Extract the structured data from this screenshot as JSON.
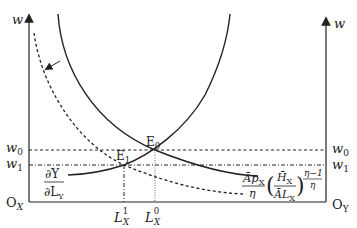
{
  "diagram": {
    "type": "labor-market-equilibrium",
    "axes": {
      "left_axis_label": "w",
      "right_axis_label": "w",
      "left_origin": "O",
      "left_origin_sub": "X",
      "right_origin": "O",
      "right_origin_sub": "Y"
    },
    "wage_levels": {
      "w0": {
        "base": "w",
        "sub": "0"
      },
      "w1": {
        "base": "w",
        "sub": "1"
      }
    },
    "labor_levels": {
      "L1": {
        "base": "L",
        "sub": "X",
        "sup": "1"
      },
      "L0": {
        "base": "L",
        "sub": "X",
        "sup": "0"
      }
    },
    "equilibria": {
      "E0": {
        "base": "E",
        "sub": "0"
      },
      "E1": {
        "base": "E",
        "sub": "1"
      }
    },
    "curves": {
      "marginal_product_Y": {
        "numerator": "∂Y",
        "denominator": "∂L",
        "denominator_sub": "Y"
      },
      "labor_demand_X": {
        "numerator": "Āp",
        "numerator_sub": "X",
        "denominator": "η",
        "inner_numerator": "H̄",
        "inner_numerator_sub": "X",
        "inner_denominator": "ĀL",
        "inner_denominator_sub": "X",
        "exponent_numerator": "η−1",
        "exponent_denominator": "η"
      }
    },
    "colors": {
      "ink": "#222222",
      "background": "#ffffff"
    }
  }
}
